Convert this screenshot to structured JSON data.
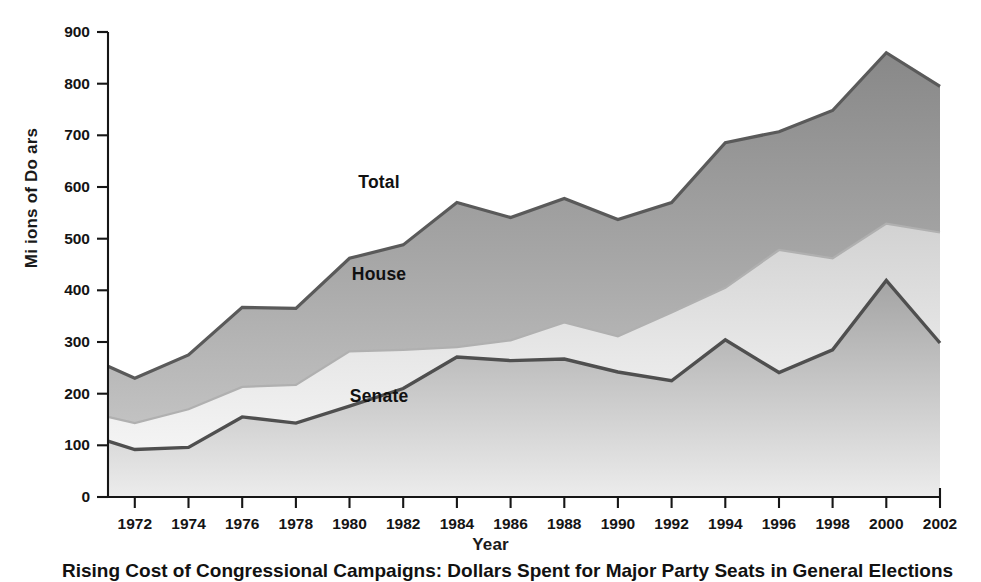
{
  "figure": {
    "caption": "Rising Cost of Congressional Campaigns: Dollars Spent for Major Party Seats in General Elections"
  },
  "axes": {
    "y_title": "Mi ions of Do ars",
    "x_title": "Year",
    "y_ticks": [
      "0",
      "100",
      "200",
      "300",
      "400",
      "500",
      "600",
      "700",
      "800",
      "900"
    ],
    "x_ticks": [
      "1972",
      "1974",
      "1976",
      "1978",
      "1980",
      "1982",
      "1984",
      "1986",
      "1988",
      "1990",
      "1992",
      "1994",
      "1996",
      "1998",
      "2000",
      "2002"
    ]
  },
  "series_labels": {
    "total": "Total",
    "house": "House",
    "senate": "Senate"
  },
  "colors": {
    "total_band_top": "#8c8c8c",
    "total_band_bottom": "#b9b9b9",
    "house_band_top": "#d7d7d7",
    "house_band_bottom": "#f0f0f0",
    "senate_band_top": "#a9a9a9",
    "senate_band_bottom": "#e4e4e4",
    "outline": "#4a4a4a",
    "axis": "#1a1a1a"
  },
  "chart_data": {
    "type": "area",
    "title": "Rising Cost of Congressional Campaigns",
    "xlabel": "Year",
    "ylabel": "Mi ions of Do ars",
    "xlim": [
      1971,
      2002
    ],
    "ylim": [
      0,
      900
    ],
    "grid": false,
    "legend": "inline-labels",
    "stacked": false,
    "note": "Senate and House are plotted as cumulative bands beneath Total; band thicknesses are Senate, House-minus-Senate, Total-minus-House.",
    "x": [
      1971,
      1972,
      1974,
      1976,
      1978,
      1980,
      1982,
      1984,
      1986,
      1988,
      1990,
      1992,
      1994,
      1996,
      1998,
      2000,
      2002
    ],
    "series": [
      {
        "name": "Total",
        "values": [
          253,
          230,
          275,
          367,
          365,
          462,
          488,
          570,
          541,
          578,
          537,
          570,
          686,
          707,
          748,
          860,
          795
        ]
      },
      {
        "name": "House",
        "values": [
          155,
          143,
          170,
          213,
          217,
          282,
          285,
          290,
          303,
          338,
          311,
          357,
          405,
          478,
          462,
          529,
          512
        ]
      },
      {
        "name": "Senate",
        "values": [
          108,
          92,
          96,
          155,
          143,
          176,
          210,
          271,
          264,
          267,
          242,
          225,
          304,
          241,
          285,
          419,
          298
        ]
      }
    ],
    "annotations": [
      {
        "text": "Total",
        "x": 1981.1,
        "y": 610
      },
      {
        "text": "House",
        "x": 1981.1,
        "y": 432
      },
      {
        "text": "Senate",
        "x": 1981.1,
        "y": 195
      }
    ]
  }
}
